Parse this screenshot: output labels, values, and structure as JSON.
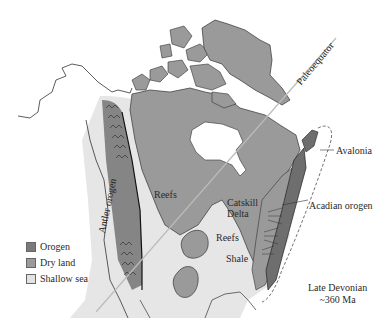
{
  "map": {
    "title": "Late Devonian",
    "age": "~360 Ma",
    "colors": {
      "orogen": "#7a7a7a",
      "dry_land": "#9a9a9a",
      "shallow_sea": "#e6e6e6",
      "ocean": "#ffffff",
      "outline": "#333333"
    },
    "labels": {
      "paleoequator": "Paleoequator",
      "antler_orogen": "Antler orogen",
      "avalonia": "Avalonia",
      "acadian_orogen": "Acadian orogen",
      "reefs_west": "Reefs",
      "reefs_central": "Reefs",
      "catskill_line1": "Catskill",
      "catskill_line2": "Delta",
      "shale": "Shale"
    },
    "legend": [
      {
        "label": "Orogen",
        "color": "#7a7a7a"
      },
      {
        "label": "Dry land",
        "color": "#9a9a9a"
      },
      {
        "label": "Shallow sea",
        "color": "#e2e2e2"
      }
    ]
  }
}
